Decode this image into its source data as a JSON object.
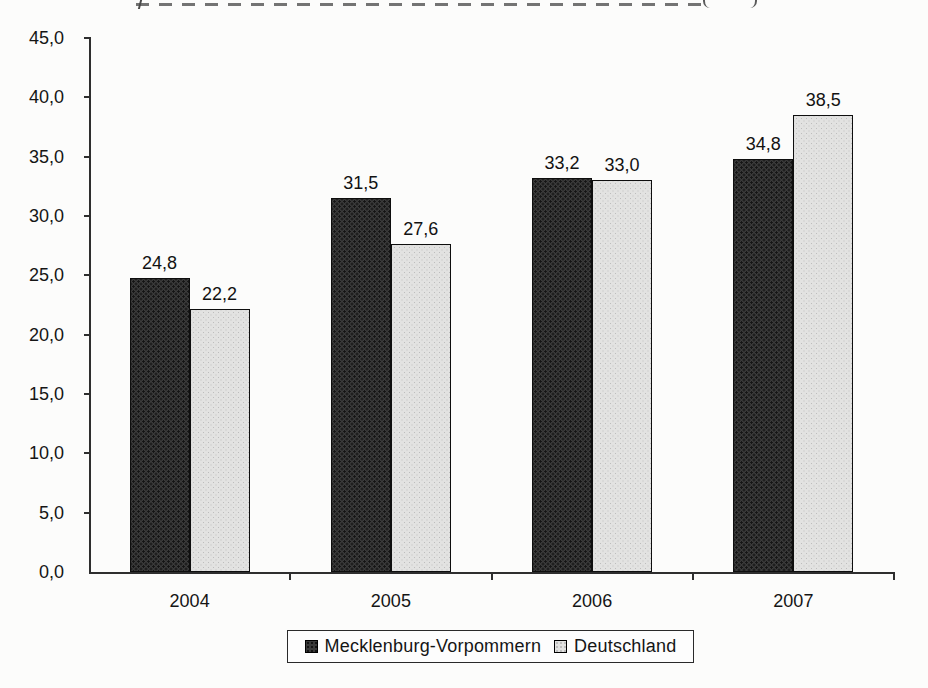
{
  "chart_data": {
    "type": "bar",
    "categories": [
      "2004",
      "2005",
      "2006",
      "2007"
    ],
    "series": [
      {
        "name": "Mecklenburg-Vorpommern",
        "values": [
          24.8,
          31.5,
          33.2,
          34.8
        ],
        "value_labels": [
          "24,8",
          "31,5",
          "33,2",
          "34,8"
        ],
        "color": "#3a3a3a"
      },
      {
        "name": "Deutschland",
        "values": [
          22.2,
          27.6,
          33.0,
          38.5
        ],
        "value_labels": [
          "22,2",
          "27,6",
          "33,0",
          "38,5"
        ],
        "color": "#e2e2e1"
      }
    ],
    "xlabel": "",
    "ylabel": "",
    "ylim": [
      0,
      45
    ],
    "y_tick_step": 5,
    "y_tick_labels": [
      "0,0",
      "5,0",
      "10,0",
      "15,0",
      "20,0",
      "25,0",
      "30,0",
      "35,0",
      "40,0",
      "45,0"
    ],
    "grid": false,
    "legend_position": "bottom"
  },
  "legend": {
    "series_1_label": "Mecklenburg-Vorpommern",
    "series_2_label": "Deutschland"
  },
  "colors": {
    "bar_dark": "#3a3a3a",
    "bar_light": "#e2e2e1",
    "axis": "#2e2e2e",
    "text": "#151515",
    "background": "#fcfcfb"
  }
}
